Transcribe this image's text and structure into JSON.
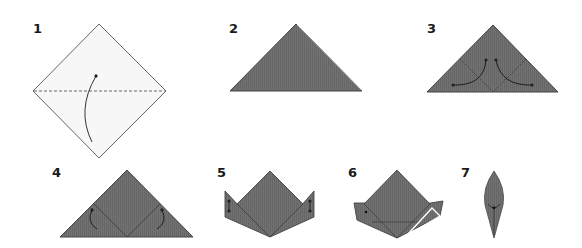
{
  "diagram": {
    "type": "origami-instructions",
    "colors": {
      "paper_white": "#f7f7f7",
      "paper_colored": "#6e6e6e",
      "outline": "#555555",
      "crease": "#3a3a3a",
      "arrow": "#222222",
      "highlight": "#ffffff",
      "background": "#ffffff"
    },
    "steps": [
      {
        "number": "1",
        "description": "Square paper rotated as a diamond, white side up, with a horizontal dashed valley-fold line and a curved arrow folding the bottom corner up to the top corner"
      },
      {
        "number": "2",
        "description": "Resulting colored triangle after folding in half"
      },
      {
        "number": "3",
        "description": "Triangle with diagonal crease lines and two curved arrows indicating bottom corners folded up toward the apex"
      },
      {
        "number": "4",
        "description": "Triangle with flaps folded, curved arrows showing folding the flaps back down"
      },
      {
        "number": "5",
        "description": "Crown-like shape with side flaps standing up, small arrows indicating folds on each side"
      },
      {
        "number": "6",
        "description": "Shape with right flap folded in, highlighted with white outline lines and a dot on the left flap"
      },
      {
        "number": "7",
        "description": "Finished leaf / petal shape, pointed at top and bottom"
      }
    ]
  }
}
